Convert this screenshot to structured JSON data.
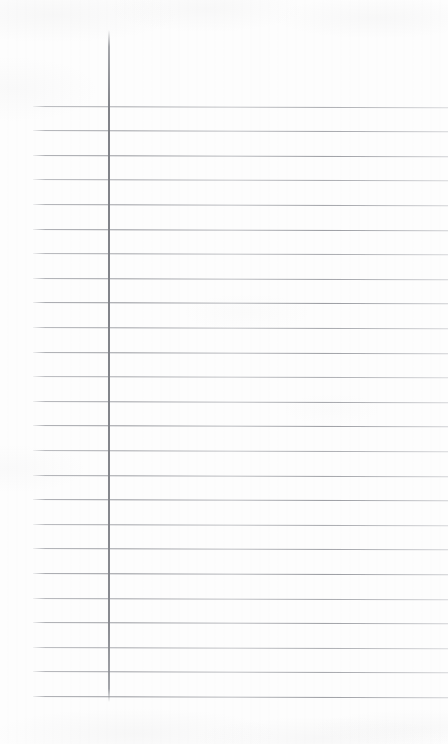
{
  "page": {
    "kind": "ruled-notebook-page",
    "width": 448,
    "height": 744,
    "background_color": "#fdfdfd",
    "content_text": "",
    "is_blank": true
  },
  "margin_rule": {
    "name": "vertical-margin-line",
    "color": "#7e8086",
    "x": 108,
    "top": 30,
    "bottom": 702,
    "width_px": 2
  },
  "ruled_lines": {
    "name": "horizontal-ruled-lines",
    "color": "#8e9096",
    "count": 25,
    "first_y": 105.5,
    "spacing": 24.6,
    "left_x": 33,
    "right_x": 448,
    "tilt_deg": 0.18,
    "positions": [
      105.5,
      130.1,
      154.7,
      179.3,
      203.9,
      228.5,
      253.1,
      277.7,
      302.3,
      326.9,
      351.5,
      376.1,
      400.7,
      425.3,
      449.9,
      474.5,
      499.1,
      523.7,
      548.3,
      572.9,
      597.5,
      622.1,
      646.7,
      671.3,
      695.9
    ]
  },
  "writing_area": {
    "name": "writing-area",
    "left": 110,
    "top": 32,
    "right": 448,
    "bottom": 700,
    "placeholder": ""
  },
  "margin_area": {
    "name": "left-margin-area",
    "left": 0,
    "right": 108,
    "placeholder": ""
  }
}
